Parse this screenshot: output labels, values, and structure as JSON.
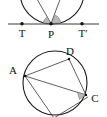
{
  "figure": {
    "background_color": "#ffffff",
    "line_color": "#1b1b1b",
    "shade_color": "#b8b8b8",
    "panels": [
      {
        "id": "top-panel",
        "name": "tangent-line-circle-panel",
        "description": "Circle tangent to a straight line at point P, two chords drawn from P, shaded angles between each chord and the tangent line",
        "labels": [
          {
            "key": "T",
            "text": "T",
            "x": 22,
            "y": 37
          },
          {
            "key": "P",
            "text": "P",
            "x": 51,
            "y": 38
          },
          {
            "key": "Tp",
            "text": "T′",
            "x": 82,
            "y": 37
          }
        ],
        "points": [
          {
            "key": "T",
            "x": 22,
            "y": 24
          },
          {
            "key": "P",
            "x": 51,
            "y": 24
          },
          {
            "key": "Tp",
            "x": 82,
            "y": 24
          }
        ],
        "tangent_line": {
          "x1": 8,
          "y1": 24,
          "x2": 99,
          "y2": 24
        },
        "circle": {
          "cx": 52,
          "cy": -8,
          "r": 32
        },
        "chords": [
          {
            "from": "P",
            "to_x": 33,
            "to_y": -6
          },
          {
            "from": "P",
            "to_x": 63,
            "to_y": -10
          }
        ],
        "angle_marks": [
          {
            "key": "angle-left-at-P",
            "label": ""
          },
          {
            "key": "angle-right-at-P",
            "label": ""
          }
        ]
      },
      {
        "id": "bottom-panel",
        "name": "inscribed-quadrilateral-panel",
        "description": "Circle with inscribed points A, D, C and chords forming triangles, shaded angle at C",
        "labels": [
          {
            "key": "D",
            "text": "D",
            "x": 70,
            "y": 55
          },
          {
            "key": "A",
            "text": "A",
            "x": 13,
            "y": 73
          },
          {
            "key": "C",
            "text": "C",
            "x": 93,
            "y": 101
          }
        ],
        "points": [
          {
            "key": "A",
            "x": 25,
            "y": 76
          },
          {
            "key": "D",
            "x": 69,
            "y": 59
          },
          {
            "key": "C",
            "x": 86,
            "y": 95
          },
          {
            "key": "B",
            "x": 54,
            "y": 117
          }
        ],
        "circle": {
          "cx": 55,
          "cy": 83,
          "r": 32
        },
        "chords": [
          {
            "from": "A",
            "to": "D"
          },
          {
            "from": "D",
            "to": "C"
          },
          {
            "from": "A",
            "to": "C"
          },
          {
            "from": "A",
            "to": "B"
          },
          {
            "from": "B",
            "to": "C"
          }
        ],
        "angle_marks": [
          {
            "key": "angle-at-C",
            "label": ""
          }
        ]
      }
    ]
  }
}
